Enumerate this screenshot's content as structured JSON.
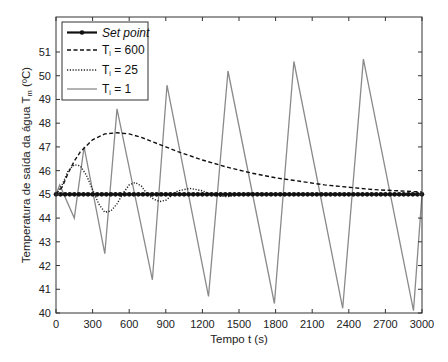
{
  "chart_data": {
    "type": "line",
    "title": "",
    "xlabel": "Tempo  t (s)",
    "ylabel": "Temperatura de saída da água T",
    "ylabel_sub": "m",
    "ylabel_unit": " (ºC)",
    "xlim": [
      0,
      3000
    ],
    "ylim": [
      40,
      52
    ],
    "xticks": [
      0,
      300,
      600,
      900,
      1200,
      1500,
      1800,
      2100,
      2400,
      2700,
      3000
    ],
    "yticks": [
      40,
      41,
      42,
      43,
      44,
      45,
      46,
      47,
      48,
      49,
      50,
      51
    ],
    "grid": false,
    "legend_position": "upper-left",
    "legend": [
      {
        "label": "Set point",
        "style": "solid-marker",
        "italic": true
      },
      {
        "label_main": "T",
        "label_sub": "i",
        "label_rest": "= 600",
        "style": "dashed"
      },
      {
        "label_main": "T",
        "label_sub": "i",
        "label_rest": "= 25",
        "style": "dotted"
      },
      {
        "label_main": "T",
        "label_sub": "i",
        "label_rest": "= 1",
        "style": "solid-gray"
      }
    ],
    "series": [
      {
        "name": "Set point",
        "x": [
          0,
          3000
        ],
        "values": [
          45.0,
          45.0
        ]
      },
      {
        "name": "Ti = 600",
        "x": [
          0,
          50,
          100,
          150,
          200,
          300,
          400,
          500,
          600,
          700,
          800,
          900,
          1000,
          1200,
          1400,
          1600,
          1800,
          2000,
          2200,
          2400,
          2600,
          2800,
          3000
        ],
        "values": [
          45.0,
          45.3,
          45.9,
          46.4,
          46.8,
          47.3,
          47.55,
          47.6,
          47.55,
          47.4,
          47.2,
          47.0,
          46.8,
          46.45,
          46.15,
          45.9,
          45.7,
          45.55,
          45.4,
          45.3,
          45.2,
          45.15,
          45.1
        ]
      },
      {
        "name": "Ti = 25",
        "x": [
          0,
          50,
          100,
          150,
          200,
          250,
          300,
          350,
          400,
          450,
          500,
          550,
          600,
          650,
          700,
          750,
          800,
          850,
          900,
          950,
          1000,
          1100,
          1200,
          1300,
          1400,
          1500,
          1600,
          1800,
          2000,
          2400,
          3000
        ],
        "values": [
          45.0,
          45.4,
          46.0,
          46.25,
          46.2,
          45.8,
          45.2,
          44.6,
          44.25,
          44.3,
          44.6,
          45.05,
          45.4,
          45.5,
          45.35,
          45.0,
          44.8,
          44.7,
          44.75,
          44.95,
          45.15,
          45.25,
          45.15,
          44.95,
          44.9,
          45.0,
          45.05,
          45.0,
          45.0,
          45.0,
          45.0
        ]
      },
      {
        "name": "Ti = 1",
        "x": [
          0,
          30,
          150,
          230,
          400,
          500,
          790,
          910,
          1250,
          1410,
          1790,
          1950,
          2350,
          2520,
          2930,
          3000
        ],
        "values": [
          45.0,
          45.4,
          44.0,
          47.0,
          42.5,
          48.6,
          41.4,
          49.6,
          40.7,
          50.2,
          40.4,
          50.6,
          40.2,
          50.7,
          40.1,
          45.0
        ]
      }
    ]
  },
  "colors": {
    "setpoint": "#111111",
    "ti600": "#111111",
    "ti25": "#222222",
    "ti1": "#8a8a8a",
    "axis": "#333333"
  }
}
